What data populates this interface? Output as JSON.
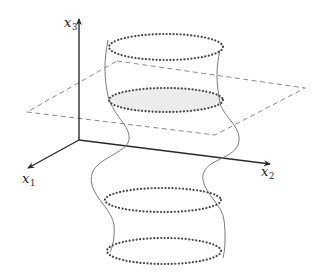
{
  "diagram": {
    "axes": {
      "x1": {
        "label": "x",
        "subscript": "1"
      },
      "x2": {
        "label": "x",
        "subscript": "2"
      },
      "x3": {
        "label": "x",
        "subscript": "3"
      }
    },
    "plane": {
      "style": "dashed",
      "color": "#8a8a8a"
    },
    "cross_sections": [
      {
        "name": "top",
        "shaded": false
      },
      {
        "name": "in-plane",
        "shaded": true,
        "fill": "#ececec"
      },
      {
        "name": "lower",
        "shaded": false
      },
      {
        "name": "bottom",
        "shaded": false
      }
    ],
    "colors": {
      "axis": "#2a2a2a",
      "surface_curve": "#7a7a7a",
      "dotted_ellipse": "#4a4a4a",
      "shade": "#ececec"
    }
  }
}
